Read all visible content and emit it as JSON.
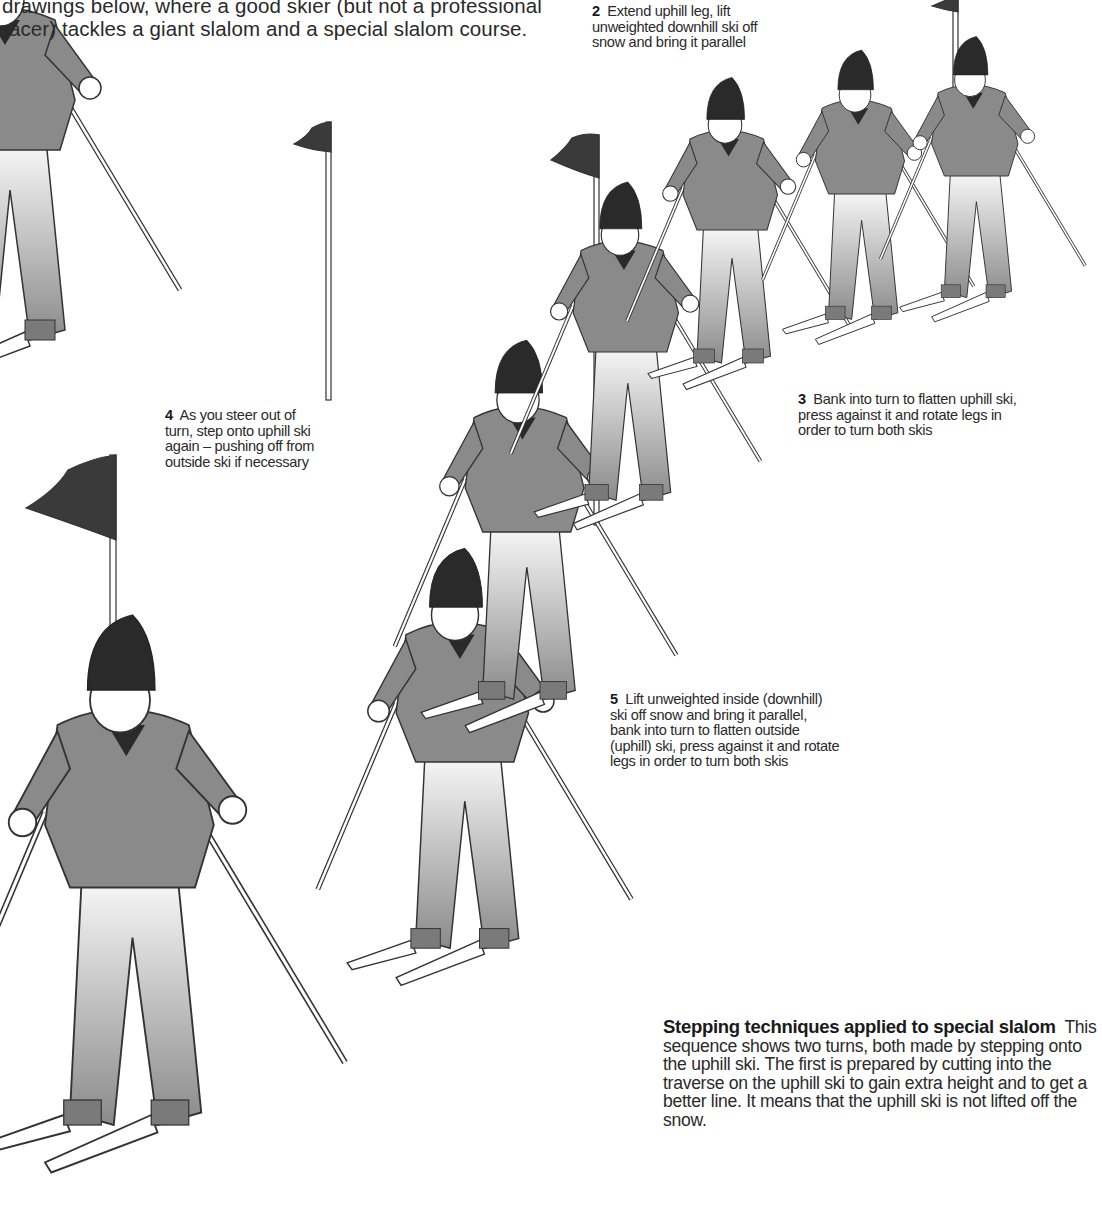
{
  "intro_text": "drawings below, where a good skier (but not a professional racer) tackles a giant slalom and a special slalom course.",
  "captions": [
    {
      "number": "2",
      "text": "Extend uphill leg, lift unweighted downhill ski off snow and bring it parallel"
    },
    {
      "number": "3",
      "text": "Bank into turn to flatten uphill ski, press against it and rotate legs in order to turn both skis"
    },
    {
      "number": "4",
      "text": "As you steer out of turn, step onto uphill ski again – pushing off from outside ski if necessary"
    },
    {
      "number": "5",
      "text": "Lift unweighted inside (downhill) ski off snow and bring it parallel, bank into turn to flatten outside (uphill) ski, press against it and rotate legs in order to turn both skis"
    }
  ],
  "summary": {
    "heading": "Stepping techniques applied to special slalom",
    "body": "This sequence shows two turns, both made by stepping onto the uphill ski. The first is prepared by cutting into the traverse on the uphill ski to gain extra height and to get a better line. It means that the uphill ski is not lifted off the snow."
  },
  "illustration": {
    "subject": "skier-sequence-special-slalom",
    "colors": {
      "sweater": "#8a8a8a",
      "hat": "#2a2a2a",
      "flag": "#3a3a3a",
      "line": "#333333",
      "pants": "#ffffff",
      "boot": "#7a7a7a"
    }
  }
}
